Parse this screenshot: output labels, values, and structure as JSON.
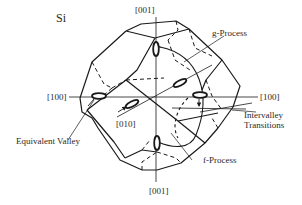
{
  "diagram": {
    "title": "Si",
    "axes": {
      "top": "[001]",
      "bottom": "[001]",
      "left": "[100]",
      "right": "[100]",
      "front": "[010]"
    },
    "annotations": {
      "g_process": "g-Process",
      "f_process": "f-Process",
      "intervalley_line1": "Intervalley",
      "intervalley_line2": "Transitions",
      "equivalent_valley": "Equivalent Valley"
    },
    "colors": {
      "line": "#1a1a1a",
      "text": "#2a2a2a",
      "background": "#ffffff"
    }
  }
}
